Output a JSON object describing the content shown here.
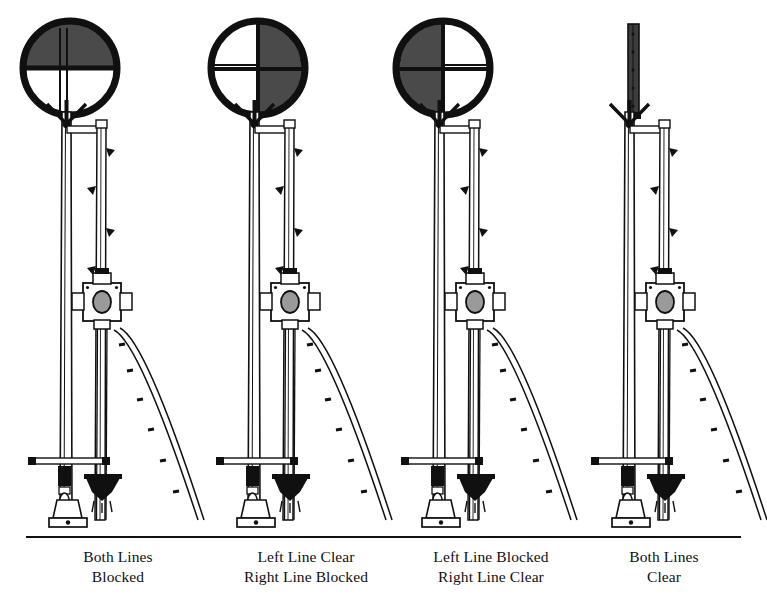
{
  "figure": {
    "kind": "technical-line-drawing",
    "background_color": "#ffffff",
    "ink_color": "#101010",
    "disc_fill_color": "#4a4a4a",
    "ground_line_y": 537
  },
  "panels": [
    {
      "id": "panel-1",
      "center_x": 93,
      "disc_center_x": 70,
      "disc_center_y": 68,
      "disc_radius": 47,
      "disc_state": "top-half-filled",
      "filled_half": "top",
      "mast_visible": true,
      "caption_line_1": "Both Lines",
      "caption_line_2": "Blocked",
      "caption_x": 118
    },
    {
      "id": "panel-2",
      "center_x": 281,
      "disc_center_x": 258,
      "disc_center_y": 68,
      "disc_radius": 47,
      "disc_state": "right-half-filled",
      "filled_half": "right",
      "mast_visible": true,
      "caption_line_1": "Left Line Clear",
      "caption_line_2": "Right Line Blocked",
      "caption_x": 306
    },
    {
      "id": "panel-3",
      "center_x": 466,
      "disc_center_x": 443,
      "disc_center_y": 68,
      "disc_radius": 47,
      "disc_state": "left-half-filled",
      "filled_half": "left",
      "mast_visible": true,
      "caption_line_1": "Left Line Blocked",
      "caption_line_2": "Right Line Clear",
      "caption_x": 491
    },
    {
      "id": "panel-4",
      "center_x": 656,
      "disc_center_x": 633,
      "disc_center_y": 68,
      "disc_radius": 47,
      "disc_state": "edge-on-folded",
      "filled_half": "none",
      "mast_visible": true,
      "caption_line_1": "Both Lines",
      "caption_line_2": "Clear",
      "caption_x": 664
    }
  ],
  "captions": {
    "line_1_y": 562,
    "line_2_y": 582
  },
  "components": {
    "disc": "signal-disc",
    "mast": "main-mast",
    "secondary_post": "secondary-post",
    "lamp_box": "lamp-spectacle-box",
    "ladder": "access-ladder",
    "base": "mast-base-pedestal",
    "crossbar": "base-crossbar",
    "bracket": "chevron-bracket"
  }
}
